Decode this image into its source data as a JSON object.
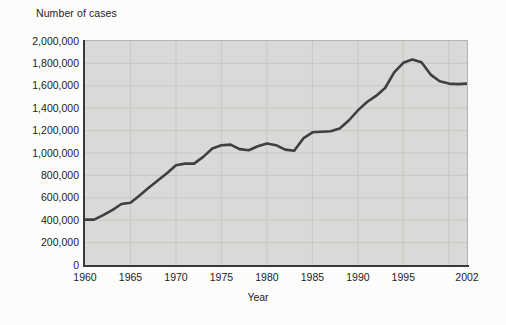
{
  "figure": {
    "y_axis_title": "Number of cases",
    "x_axis_title": "Year"
  },
  "colors": {
    "page_background": "#fcfcfa",
    "plot_background": "#d9d9d7",
    "gridline": "#c7c7c5",
    "axis": "#3a3a3a",
    "border": "#b3b3b1",
    "line": "#3f3f3f",
    "text": "#1c1c1c"
  },
  "chart_data": {
    "type": "line",
    "title": "Number of cases",
    "xlabel": "Year",
    "ylabel": "Number of cases",
    "xlim": [
      1960,
      2002
    ],
    "ylim": [
      0,
      2000000
    ],
    "grid": true,
    "legend": false,
    "x_tick_values": [
      1960,
      1965,
      1970,
      1975,
      1980,
      1985,
      1990,
      1995,
      2002
    ],
    "x_tick_labels": [
      "1960",
      "1965",
      "1970",
      "1975",
      "1980",
      "1985",
      "1990",
      "1995",
      "2002"
    ],
    "y_tick_values": [
      0,
      200000,
      400000,
      600000,
      800000,
      1000000,
      1200000,
      1400000,
      1600000,
      1800000,
      2000000
    ],
    "y_tick_labels": [
      "0",
      "200,000",
      "400,000",
      "600,000",
      "800,000",
      "1,000,000",
      "1,200,000",
      "1,400,000",
      "1,600,000",
      "1,800,000",
      "2,000,000"
    ],
    "x_gridline_values": [
      1965,
      1970,
      1975,
      1980,
      1985,
      1990,
      1995,
      2000
    ],
    "series": [
      {
        "name": "Number of cases",
        "x": [
          1960,
          1961,
          1962,
          1963,
          1964,
          1965,
          1966,
          1967,
          1968,
          1969,
          1970,
          1971,
          1972,
          1973,
          1974,
          1975,
          1976,
          1977,
          1978,
          1979,
          1980,
          1981,
          1982,
          1983,
          1984,
          1985,
          1986,
          1987,
          1988,
          1989,
          1990,
          1991,
          1992,
          1993,
          1994,
          1995,
          1996,
          1997,
          1998,
          1999,
          2000,
          2001,
          2002
        ],
        "values": [
          405000,
          405000,
          445000,
          490000,
          545000,
          555000,
          620000,
          690000,
          755000,
          820000,
          890000,
          905000,
          905000,
          965000,
          1040000,
          1070000,
          1075000,
          1035000,
          1025000,
          1060000,
          1085000,
          1070000,
          1030000,
          1020000,
          1130000,
          1185000,
          1190000,
          1195000,
          1220000,
          1290000,
          1380000,
          1455000,
          1510000,
          1580000,
          1720000,
          1805000,
          1835000,
          1810000,
          1700000,
          1640000,
          1620000,
          1615000,
          1620000
        ]
      }
    ]
  }
}
